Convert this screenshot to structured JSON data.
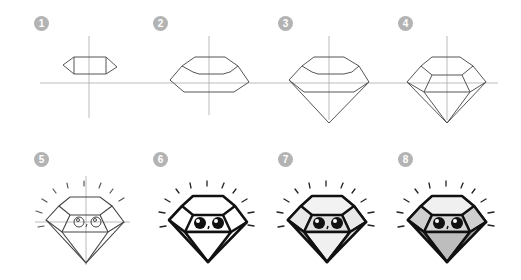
{
  "colors": {
    "badge": "#b3b3b3",
    "guide": "#9a9a9a",
    "sketch": "#555555",
    "ink": "#111111",
    "fill_light": "#eeeeee",
    "fill_mid": "#d6d6d6",
    "fill_dark": "#bdbdbd"
  },
  "steps": [
    {
      "number": "1",
      "label": "Draw a flat hexagon on the guide lines"
    },
    {
      "number": "2",
      "label": "Expand the crown shape"
    },
    {
      "number": "3",
      "label": "Add the pointed pavilion"
    },
    {
      "number": "4",
      "label": "Add facet lines"
    },
    {
      "number": "5",
      "label": "Draw eyes and sparkle lines"
    },
    {
      "number": "6",
      "label": "Ink the outlines"
    },
    {
      "number": "7",
      "label": "Add light shading"
    },
    {
      "number": "8",
      "label": "Add gray tones"
    }
  ]
}
